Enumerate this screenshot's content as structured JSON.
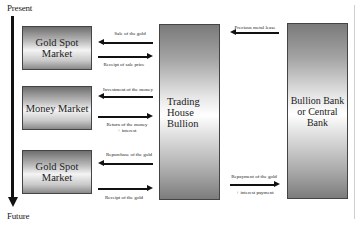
{
  "timeline": {
    "start_label": "Present",
    "end_label": "Future"
  },
  "left_boxes": [
    {
      "id": "gold-spot-market-1",
      "label": "Gold Spot\nMarket"
    },
    {
      "id": "money-market",
      "label": "Money Market"
    },
    {
      "id": "gold-spot-market-2",
      "label": "Gold Spot\nMarket"
    }
  ],
  "center_box": {
    "label": "Trading\nHouse\nBullion"
  },
  "right_box": {
    "label": "Bullion Bank\nor Central\nBank"
  },
  "flows": [
    {
      "from": "Trading House Bullion",
      "to": "Gold Spot Market",
      "direction": "left",
      "label": "Sale of the gold"
    },
    {
      "from": "Gold Spot Market",
      "to": "Trading House Bullion",
      "direction": "right",
      "label": "Receipt of sale price"
    },
    {
      "from": "Trading House Bullion",
      "to": "Money Market",
      "direction": "left",
      "label": "Investment of the money"
    },
    {
      "from": "Money Market",
      "to": "Trading House Bullion",
      "direction": "right",
      "label": "Return of the money\n+ interest"
    },
    {
      "from": "Trading House Bullion",
      "to": "Gold Spot Market",
      "direction": "left",
      "label": "Repurchase of the gold"
    },
    {
      "from": "Gold Spot Market",
      "to": "Trading House Bullion",
      "direction": "right",
      "label": "Receipt of the gold"
    },
    {
      "from": "Bullion Bank or Central Bank",
      "to": "Trading House Bullion",
      "direction": "left",
      "label": "Precious metal lease"
    },
    {
      "from": "Trading House Bullion",
      "to": "Bullion Bank or Central Bank",
      "direction": "right",
      "label": "Repayment of the gold",
      "sublabel": "+ interest payment"
    }
  ]
}
